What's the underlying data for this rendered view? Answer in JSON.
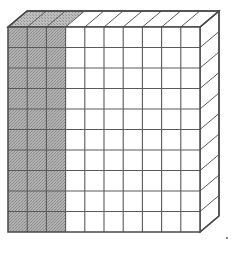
{
  "figure": {
    "name": "base-ten-hundreds-flat",
    "total_units": 100,
    "shaded_units": 30,
    "unshaded_units": 70,
    "fraction_shaded": "30/100",
    "decimal_shaded": "0.30",
    "percent_shaded": "30%"
  },
  "grid": {
    "rows": 10,
    "columns": 10,
    "shaded_columns": 3,
    "unshaded_columns": 7,
    "shaded_column_indices": [
      0,
      1,
      2
    ]
  },
  "geometry": {
    "front_left_x": 8,
    "front_top_y": 27,
    "front_width": 192,
    "front_height": 205,
    "depth_dx": 19,
    "depth_dy": -16
  },
  "colors": {
    "outline": "#4a4a4a",
    "gridline": "#5a5a5a",
    "shaded_fill": "#a9a9a9",
    "shaded_stipple": "#8e8e8e",
    "unshaded_fill": "#ffffff",
    "top_face_fill": "#ffffff",
    "side_face_fill": "#ffffff",
    "background": "#ffffff",
    "artifact": "#8a8a8a"
  },
  "artifact": {
    "name": "scan-speck",
    "x": 226,
    "y": 237,
    "width": 2,
    "height": 2
  }
}
